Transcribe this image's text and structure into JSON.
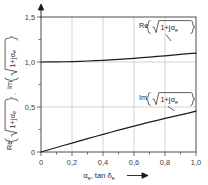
{
  "chart_data": {
    "type": "line",
    "title": "",
    "xlabel": "αe, tan δe",
    "ylabel": "Re{√(1+jαe)}, Im{√(1+jαe)}",
    "xlim": [
      0,
      1.0
    ],
    "ylim": [
      0,
      1.5
    ],
    "grid": true,
    "legend_position": "inline-annotations",
    "x_ticks": [
      "0",
      "0,2",
      "0,4",
      "0,6",
      "0,8",
      "1,0"
    ],
    "x_tick_values": [
      0,
      0.2,
      0.4,
      0.6,
      0.8,
      1.0
    ],
    "y_ticks": [
      "0",
      "0,5",
      "1,0",
      "1,5"
    ],
    "y_tick_values": [
      0,
      0.5,
      1.0,
      1.5
    ],
    "x": [
      0,
      0.05,
      0.1,
      0.15,
      0.2,
      0.25,
      0.3,
      0.35,
      0.4,
      0.45,
      0.5,
      0.55,
      0.6,
      0.65,
      0.7,
      0.75,
      0.8,
      0.85,
      0.9,
      0.95,
      1.0
    ],
    "series": [
      {
        "name": "Re{√(1+jαe)}",
        "label": "Re",
        "values": [
          1.0,
          1.0003,
          1.0012,
          1.0028,
          1.005,
          1.0077,
          1.0111,
          1.0149,
          1.0193,
          1.0241,
          1.0294,
          1.0351,
          1.0412,
          1.0477,
          1.0545,
          1.0617,
          1.0691,
          1.0769,
          1.0849,
          1.0931,
          1.0987
        ],
        "annotation": "Re{√(1+jαe)}"
      },
      {
        "name": "Im{√(1+jαe)}",
        "label": "Im",
        "values": [
          0.0,
          0.025,
          0.05,
          0.0748,
          0.0995,
          0.124,
          0.1483,
          0.1723,
          0.196,
          0.2194,
          0.2425,
          0.2652,
          0.2875,
          0.3094,
          0.3309,
          0.3519,
          0.3725,
          0.3927,
          0.4124,
          0.4317,
          0.4551
        ],
        "annotation": "Im{√(1+jαe)}"
      }
    ]
  },
  "labels": {
    "y_tick_15": "1,5",
    "y_tick_10": "1,0",
    "y_tick_05": "0,5",
    "y_tick_00": "0",
    "x_tick_00": "0",
    "x_tick_02": "0,2",
    "x_tick_04": "0,4",
    "x_tick_06": "0,6",
    "x_tick_08": "0,8",
    "x_tick_10": "1,0",
    "re_annotation_prefix": "Re",
    "im_annotation_prefix": "Im",
    "radicand": "1+j",
    "alpha_symbol": "α",
    "alpha_subscript": "e",
    "delta_symbol": "δ",
    "delta_subscript": "e",
    "x_axis_alpha": "α",
    "x_axis_tan": ", tan ",
    "y_axis_re": "Re",
    "y_axis_im": "Im",
    "comma_sep": ", "
  },
  "colors": {
    "curve": "#1c1c1c",
    "frame": "#5e5e5e",
    "grid": "#c8c8c8",
    "text": "#2b2b2b",
    "background": "#ffffff"
  }
}
